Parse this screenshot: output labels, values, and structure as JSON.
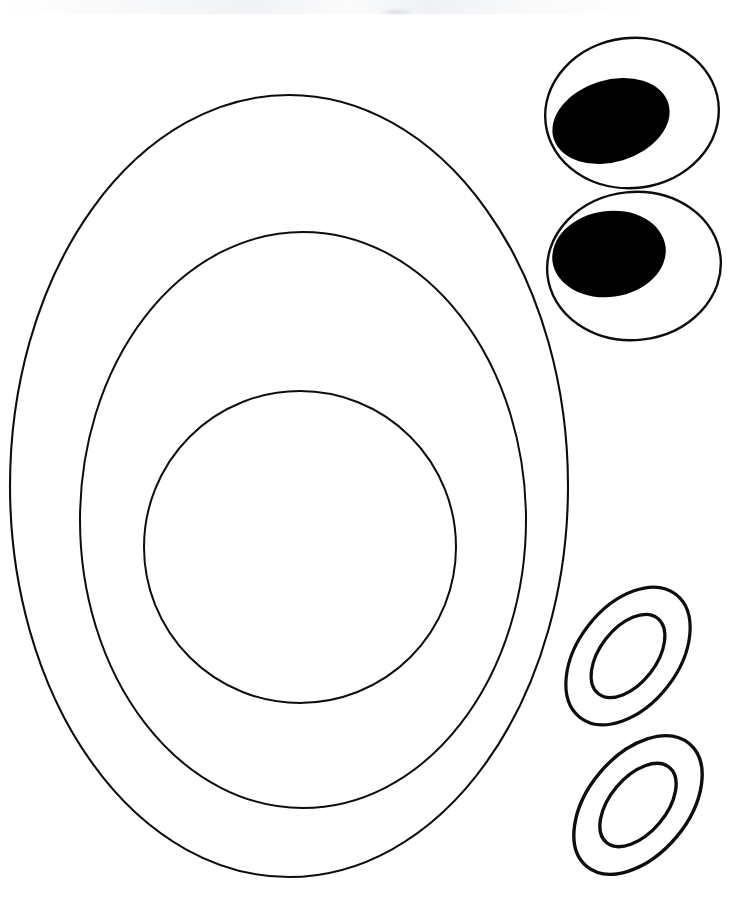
{
  "canvas": {
    "width": 742,
    "height": 915,
    "background_color": "#ffffff",
    "stroke_color": "#0d0d0d",
    "fill_color": "#000000",
    "title": "Concentric Ellipse and Eye Shape Template"
  },
  "chart_data": {
    "type": "diagram",
    "stroke_color": "#0d0d0d",
    "fill_color": "#000000",
    "background_color": "#ffffff",
    "shapes": [
      {
        "name": "outer-ellipse",
        "group": "concentric-ellipses",
        "kind": "ellipse-outline",
        "cx": 289,
        "cy": 486,
        "rx": 279,
        "ry": 391,
        "rotation": 0,
        "stroke_width": 2.1,
        "filled": false
      },
      {
        "name": "middle-ellipse",
        "group": "concentric-ellipses",
        "kind": "ellipse-outline",
        "cx": 303,
        "cy": 520,
        "rx": 223,
        "ry": 288,
        "rotation": 0,
        "stroke_width": 2.0,
        "filled": false
      },
      {
        "name": "inner-ellipse",
        "group": "concentric-ellipses",
        "kind": "ellipse-outline",
        "cx": 300,
        "cy": 547,
        "rx": 156,
        "ry": 156,
        "rotation": 0,
        "stroke_width": 2.0,
        "filled": false
      },
      {
        "name": "eye-top-outline",
        "group": "eye-top",
        "kind": "ellipse-outline",
        "cx": 632,
        "cy": 113,
        "rx": 87,
        "ry": 75,
        "rotation": -7,
        "stroke_width": 2.4,
        "filled": false
      },
      {
        "name": "eye-top-pupil",
        "group": "eye-top",
        "kind": "ellipse-filled",
        "cx": 611,
        "cy": 121,
        "rx": 60,
        "ry": 41,
        "rotation": -17,
        "stroke_width": 0,
        "filled": true
      },
      {
        "name": "eye-bottom-outline",
        "group": "eye-bottom",
        "kind": "ellipse-outline",
        "cx": 634,
        "cy": 266,
        "rx": 87,
        "ry": 74,
        "rotation": -6,
        "stroke_width": 2.4,
        "filled": false
      },
      {
        "name": "eye-bottom-pupil",
        "group": "eye-bottom",
        "kind": "ellipse-filled",
        "cx": 609,
        "cy": 254,
        "rx": 57,
        "ry": 43,
        "rotation": -8,
        "stroke_width": 0,
        "filled": true
      },
      {
        "name": "ring-upper-outer",
        "group": "ring-upper",
        "kind": "ellipse-outline",
        "cx": 628,
        "cy": 656,
        "rx": 78,
        "ry": 50,
        "rotation": -52,
        "stroke_width": 3.2,
        "filled": false
      },
      {
        "name": "ring-upper-inner",
        "group": "ring-upper",
        "kind": "ellipse-outline",
        "cx": 628,
        "cy": 656,
        "rx": 48,
        "ry": 28,
        "rotation": -52,
        "stroke_width": 3.2,
        "filled": false
      },
      {
        "name": "ring-lower-outer",
        "group": "ring-lower",
        "kind": "ellipse-outline",
        "cx": 638,
        "cy": 805,
        "rx": 80,
        "ry": 50,
        "rotation": -50,
        "stroke_width": 3.4,
        "filled": false
      },
      {
        "name": "ring-lower-inner",
        "group": "ring-lower",
        "kind": "ellipse-outline",
        "cx": 638,
        "cy": 805,
        "rx": 49,
        "ry": 28,
        "rotation": -50,
        "stroke_width": 3.4,
        "filled": false
      }
    ]
  }
}
